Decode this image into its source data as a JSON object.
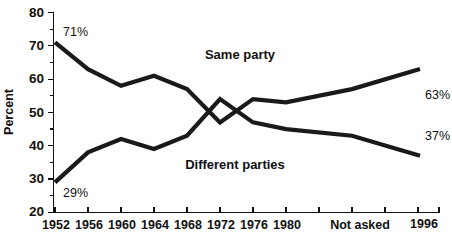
{
  "chart_data": {
    "type": "line",
    "title": "",
    "subtitle": "",
    "xlabel": "",
    "ylabel": "Percent",
    "ylim": [
      20,
      80
    ],
    "yticks": [
      20,
      30,
      40,
      50,
      60,
      70,
      80
    ],
    "ytick_labels": [
      "20",
      "30",
      "40",
      "50",
      "60",
      "70",
      "80"
    ],
    "grid": false,
    "legend_position": "inline-annotation",
    "categories": [
      "1952",
      "1956",
      "1960",
      "1964",
      "1968",
      "1972",
      "1976",
      "1980",
      "Not asked",
      "1996"
    ],
    "xtick_labels": [
      "1952",
      "1956",
      "1960",
      "1964",
      "1968",
      "1972",
      "1976",
      "1980",
      "Not asked",
      "1996"
    ],
    "gap_note": "Not asked",
    "series": [
      {
        "name": "Same party",
        "values": [
          71,
          63,
          58,
          61,
          57,
          47,
          54,
          53,
          57,
          63
        ],
        "start_label": "71%",
        "end_label": "63%"
      },
      {
        "name": "Different parties",
        "values": [
          29,
          38,
          42,
          39,
          43,
          54,
          47,
          45,
          43,
          37
        ],
        "start_label": "29%",
        "end_label": "37%"
      }
    ],
    "annotations": [
      {
        "text": "71%",
        "series": "Same party",
        "position": "above-first-point"
      },
      {
        "text": "29%",
        "series": "Different parties",
        "position": "below-first-point"
      },
      {
        "text": "63%",
        "series": "Same party",
        "position": "right-of-last-point"
      },
      {
        "text": "37%",
        "series": "Different parties",
        "position": "right-of-last-point"
      },
      {
        "text": "Same party",
        "position": "upper-middle"
      },
      {
        "text": "Different parties",
        "position": "lower-middle"
      }
    ],
    "colors": {
      "line": "#1a1a1a",
      "axis": "#111111",
      "text": "#111111",
      "background": "#ffffff"
    }
  },
  "labels": {
    "y_axis_title": "Percent",
    "series_same": "Same party",
    "series_different": "Different parties",
    "annotation_start_same": "71%",
    "annotation_start_different": "29%",
    "annotation_end_same": "63%",
    "annotation_end_different": "37%",
    "not_asked": "Not asked",
    "y0": "20",
    "y1": "30",
    "y2": "40",
    "y3": "50",
    "y4": "60",
    "y5": "70",
    "y6": "80",
    "x0": "1952",
    "x1": "1956",
    "x2": "1960",
    "x3": "1964",
    "x4": "1968",
    "x5": "1972",
    "x6": "1976",
    "x7": "1980",
    "x8": "1996"
  }
}
